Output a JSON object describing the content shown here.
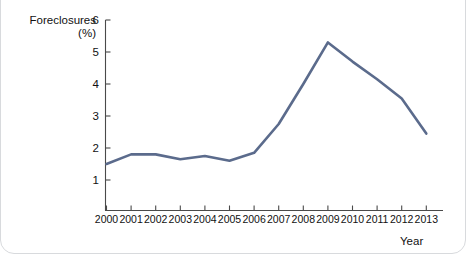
{
  "chart_data": {
    "type": "line",
    "title": "",
    "xlabel": "Year",
    "ylabel": "Foreclosures (%)",
    "ylabel_line1": "Foreclosures",
    "ylabel_line2": "(%)",
    "categories": [
      "2000",
      "2001",
      "2002",
      "2003",
      "2004",
      "2005",
      "2006",
      "2007",
      "2008",
      "2009",
      "2010",
      "2011",
      "2012",
      "2013"
    ],
    "values": [
      1.5,
      1.8,
      1.8,
      1.65,
      1.75,
      1.6,
      1.85,
      2.75,
      4.0,
      5.3,
      4.7,
      4.15,
      3.55,
      2.45
    ],
    "series": [
      {
        "name": "Foreclosures (%)",
        "values": [
          1.5,
          1.8,
          1.8,
          1.65,
          1.75,
          1.6,
          1.85,
          2.75,
          4.0,
          5.3,
          4.7,
          4.15,
          3.55,
          2.45
        ]
      }
    ],
    "ylim": [
      0,
      6
    ],
    "y_ticks": [
      1,
      2,
      3,
      4,
      5,
      6
    ],
    "y_tick_labels": [
      "1",
      "2",
      "3",
      "4",
      "5",
      "6"
    ],
    "x_tick_labels": [
      "2000",
      "2001",
      "2002",
      "2003",
      "2004",
      "2005",
      "2006",
      "2007",
      "2008",
      "2009",
      "2010",
      "2011",
      "2012",
      "2013"
    ],
    "grid": false,
    "legend": false,
    "legend_position": "none",
    "line_color": "#5b6b8c",
    "axis_color": "#4a4a4a",
    "background_color": "#ffffff"
  }
}
